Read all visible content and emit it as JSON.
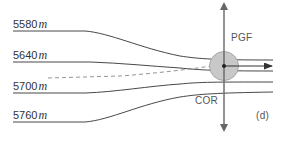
{
  "diagram": {
    "panel_label": "(d)",
    "contours": [
      {
        "value": "5580",
        "unit": "m"
      },
      {
        "value": "5640",
        "unit": "m"
      },
      {
        "value": "5700",
        "unit": "m"
      },
      {
        "value": "5760",
        "unit": "m"
      }
    ],
    "forces": {
      "pgf": "PGF",
      "cor": "COR"
    },
    "colors": {
      "line": "#333333",
      "dashed": "#888888",
      "parcel_fill": "#c8c8c8",
      "parcel_stroke": "#999999",
      "arrow": "#666666"
    }
  }
}
